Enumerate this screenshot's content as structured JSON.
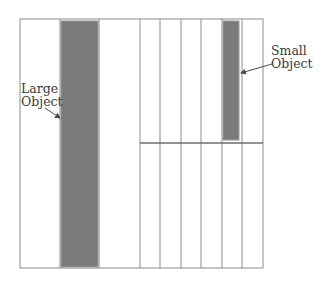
{
  "diagram": {
    "type": "memory-allocation-blocks",
    "colors": {
      "background": "#ffffff",
      "grid_line": "#8c8c8c",
      "object_fill": "#7a7a7a",
      "object_border": "#9a9a9a",
      "text": "#3a3a3a"
    },
    "container": {
      "x": 20,
      "y": 19,
      "width": 243,
      "height": 249
    },
    "vertical_lines_x": [
      60,
      98,
      140,
      160,
      181,
      201,
      222,
      242
    ],
    "horizontal_divider": {
      "y": 143,
      "x1": 140,
      "x2": 263
    },
    "objects": [
      {
        "id": "large",
        "label_line1": "Large",
        "label_line2": "Object",
        "rect": {
          "x": 61,
          "y": 21,
          "width": 37,
          "height": 246
        },
        "arrow": {
          "x1": 45,
          "y1": 108,
          "x2": 60,
          "y2": 118
        }
      },
      {
        "id": "small",
        "label_line1": "Small",
        "label_line2": "Object",
        "rect": {
          "x": 223,
          "y": 21,
          "width": 16,
          "height": 119
        },
        "arrow": {
          "x1": 272,
          "y1": 64,
          "x2": 241,
          "y2": 73
        }
      }
    ]
  }
}
